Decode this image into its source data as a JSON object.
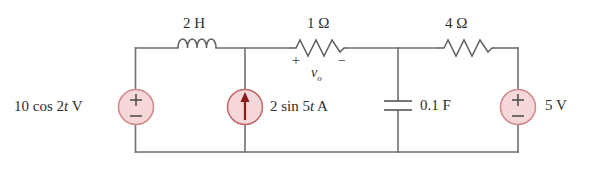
{
  "figure": {
    "kind": "circuit-schematic",
    "title": "",
    "background_color": "#ffffff",
    "wire_color": "#6e6e6e",
    "source_fill_color": "#f6d7d7",
    "source_stroke_color": "#d98d8d",
    "arrow_color": "#8b1a1a",
    "text_color": "#2e2e2e"
  },
  "labels": {
    "inductor": "2 H",
    "resistor_1ohm": "1 Ω",
    "resistor_4ohm": "4 Ω",
    "voltage_source_left": "10 cos 2t V",
    "current_source": "2 sin 5t A",
    "capacitor": "0.1 F",
    "voltage_source_right": "5 V",
    "vo_symbol": "v",
    "vo_subscript": "o",
    "polarity_plus": "+",
    "polarity_minus": "−",
    "source_plus": "+",
    "source_minus": "−"
  },
  "components": [
    {
      "name": "inductor",
      "type": "inductor",
      "value": "2 H",
      "branch": "top-left"
    },
    {
      "name": "resistor-1ohm",
      "type": "resistor",
      "value": "1 Ω",
      "branch": "top-middle",
      "measured_voltage": "vo"
    },
    {
      "name": "resistor-4ohm",
      "type": "resistor",
      "value": "4 Ω",
      "branch": "top-right"
    },
    {
      "name": "voltage-source-left",
      "type": "independent-voltage-source",
      "value": "10 cos 2t V",
      "branch": "left-vertical",
      "polarity_top": "+",
      "polarity_bottom": "−"
    },
    {
      "name": "current-source",
      "type": "independent-current-source",
      "value": "2 sin 5t A",
      "branch": "middle-vertical",
      "arrow_direction": "up"
    },
    {
      "name": "capacitor",
      "type": "capacitor",
      "value": "0.1 F",
      "branch": "right-middle-vertical"
    },
    {
      "name": "voltage-source-right",
      "type": "independent-voltage-source",
      "value": "5 V",
      "branch": "right-vertical",
      "polarity_top": "+",
      "polarity_bottom": "−"
    }
  ]
}
